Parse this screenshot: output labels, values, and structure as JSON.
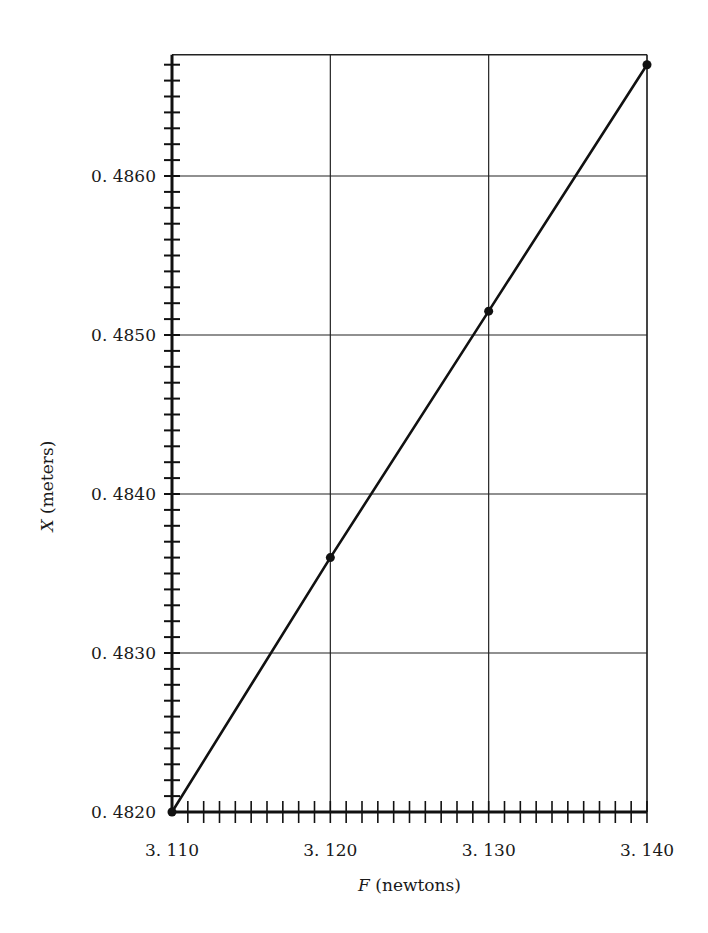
{
  "chart_data": {
    "type": "line",
    "title": "",
    "xlabel": "F (newtons)",
    "ylabel": "X (meters)",
    "xlabel_var": "F",
    "xlabel_unit": "(newtons)",
    "ylabel_var": "X",
    "ylabel_unit": "(meters)",
    "x_tick_labels": [
      "3.110",
      "3.120",
      "3.130",
      "3.140"
    ],
    "y_tick_labels": [
      "0.4820",
      "0.4830",
      "0.4840",
      "0.4850",
      "0.4860"
    ],
    "xlim": [
      3.11,
      3.14
    ],
    "ylim": [
      0.482,
      0.4867
    ],
    "grid": true,
    "legend": "none",
    "series": [
      {
        "name": "X vs F",
        "x": [
          3.11,
          3.12,
          3.13,
          3.14
        ],
        "values": [
          0.482,
          0.4836,
          0.48515,
          0.4867
        ]
      }
    ],
    "colors": {
      "line": "#111111",
      "grid": "#222222",
      "background": "#ffffff"
    }
  }
}
